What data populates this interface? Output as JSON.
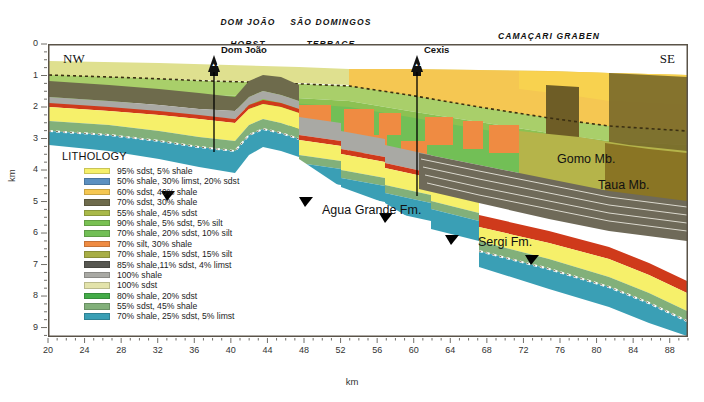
{
  "figure": {
    "type": "geological-cross-section",
    "orientation_left": "NW",
    "orientation_right": "SE",
    "xlabel": "km",
    "ylabel": "km"
  },
  "provinces": [
    {
      "name": "dom-joao-horst",
      "line1": "DOM JOÃO",
      "line2": "HORST",
      "x": 186,
      "y": 6,
      "w": 110
    },
    {
      "name": "sao-domingos-terrace",
      "line1": "SÃO DOMINGOS",
      "line2": "TERRACE",
      "x": 258,
      "y": 6,
      "w": 130
    },
    {
      "name": "camacari-graben",
      "line1": "CAMAÇARI GRABEN",
      "line2": "",
      "x": 452,
      "y": 20,
      "w": 180
    }
  ],
  "wells": [
    {
      "name": "dom-joao",
      "label": "Dom João",
      "x_px": 214,
      "label_x": 221,
      "label_y": 45,
      "depth_px": 108
    },
    {
      "name": "cexis",
      "label": "Cexis",
      "x_px": 417,
      "label_x": 424,
      "label_y": 45,
      "depth_px": 150
    }
  ],
  "unit_labels": [
    {
      "name": "agua-grande-fm",
      "text": "Agua Grande Fm.",
      "x": 322,
      "y": 203
    },
    {
      "name": "sergi-fm",
      "text": "Sergi Fm.",
      "x": 478,
      "y": 235
    },
    {
      "name": "gomo-mb",
      "text": "Gomo Mb.",
      "x": 557,
      "y": 152
    },
    {
      "name": "taua-mb",
      "text": "Taua Mb.",
      "x": 598,
      "y": 178
    }
  ],
  "chart_data": {
    "type": "area",
    "title": "",
    "xlabel": "km",
    "ylabel": "km",
    "xlim": [
      20,
      90
    ],
    "ylim": [
      0,
      9.3
    ],
    "y_inverted": true,
    "xticks": [
      20,
      24,
      28,
      32,
      36,
      40,
      44,
      48,
      52,
      56,
      60,
      64,
      68,
      72,
      76,
      80,
      84,
      88
    ],
    "xticks_minor_step": 1,
    "yticks": [
      0,
      1,
      2,
      3,
      4,
      5,
      6,
      7,
      8,
      9
    ],
    "yticks_minor_step": 0.25,
    "grid": false,
    "legend_position": "inside-lower-left"
  },
  "legend": {
    "title": "LITHOLOGY",
    "items": [
      {
        "name": "lith-95-sdst-5-shale",
        "color": "#f6f06a",
        "label": "95% sdst, 5% shale"
      },
      {
        "name": "lith-50-shale-30-limst-20-sdst",
        "color": "#5b8fc0",
        "label": "50% shale, 30% limst, 20% sdst"
      },
      {
        "name": "lith-60-sdst-40-shale",
        "color": "#f5c752",
        "label": "60% sdst, 40% shale"
      },
      {
        "name": "lith-70-sdst-30-shale",
        "color": "#6e6b4c",
        "label": "70% sdst, 30% shale"
      },
      {
        "name": "lith-55-shale-45-sdst",
        "color": "#a9b949",
        "label": "55% shale, 45% sdst"
      },
      {
        "name": "lith-90-shale-5-sdst-5-silt",
        "color": "#79c153",
        "label": "90% shale, 5% sdst, 5% silt"
      },
      {
        "name": "lith-70-shale-20-sdst-10-silt",
        "color": "#72bf56",
        "label": "70% shale, 20% sdst, 10% silt"
      },
      {
        "name": "lith-70-silt-30-shale",
        "color": "#ef8b42",
        "label": "70% silt, 30% shale"
      },
      {
        "name": "lith-70-shale-15-sdst-15-silt",
        "color": "#a8ae45",
        "label": "70% shale, 15% sdst, 15% silt"
      },
      {
        "name": "lith-85-shale-11-sdst-4-limst",
        "color": "#575751",
        "label": "85% shale,11% sdst, 4% limst"
      },
      {
        "name": "lith-100-shale",
        "color": "#a9a9a4",
        "label": "100% shale"
      },
      {
        "name": "lith-100-sdst",
        "color": "#e3e3ab",
        "label": "100% sdst"
      },
      {
        "name": "lith-80-shale-20-sdst",
        "color": "#43ab48",
        "label": "80% shale, 20% sdst"
      },
      {
        "name": "lith-55-sdst-45-shale",
        "color": "#82b07a",
        "label": "55% sdst, 45% shale"
      },
      {
        "name": "lith-70-shale-25-sdst-5-limst",
        "color": "#3a9fb5",
        "label": "70% shale, 25% sdst, 5% limst"
      }
    ]
  },
  "axes": {
    "x_tick_labels": [
      "20",
      "24",
      "28",
      "32",
      "36",
      "40",
      "44",
      "48",
      "52",
      "56",
      "60",
      "64",
      "68",
      "72",
      "76",
      "80",
      "84",
      "88"
    ],
    "y_tick_labels": [
      "0",
      "1",
      "2",
      "3",
      "4",
      "5",
      "6",
      "7",
      "8",
      "9"
    ]
  }
}
